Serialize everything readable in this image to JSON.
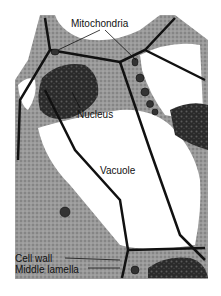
{
  "figure": {
    "labels": {
      "mitochondria": "Mitochondria",
      "nucleus": "Nucleus",
      "vacuole": "Vacuole",
      "cell_wall": "Cell wall",
      "middle_lamella": "Middle lamella"
    }
  }
}
